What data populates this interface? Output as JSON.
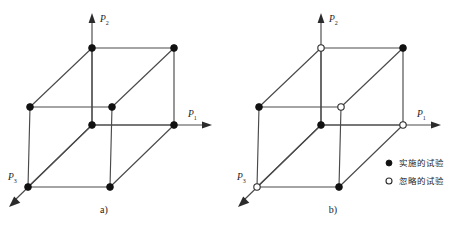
{
  "figure": {
    "title": "",
    "panels": [
      {
        "id": "a",
        "caption": "a)",
        "axes": [
          {
            "name": "p2-axis",
            "base": "P",
            "sub": "2",
            "label": "P2",
            "direction": "up"
          },
          {
            "name": "p1-axis",
            "base": "P",
            "sub": "1",
            "label": "P1",
            "direction": "right"
          },
          {
            "name": "p3-axis",
            "base": "P",
            "sub": "3",
            "label": "P3",
            "direction": "down-left"
          }
        ],
        "vertices": [
          {
            "name": "top-back-left",
            "x": 92,
            "y": 48,
            "state": "filled"
          },
          {
            "name": "top-back-right",
            "x": 174,
            "y": 48,
            "state": "filled"
          },
          {
            "name": "top-front-left",
            "x": 30,
            "y": 107,
            "state": "filled"
          },
          {
            "name": "top-front-right",
            "x": 112,
            "y": 107,
            "state": "filled"
          },
          {
            "name": "bottom-back-left",
            "x": 92,
            "y": 125,
            "state": "filled"
          },
          {
            "name": "bottom-back-right",
            "x": 174,
            "y": 125,
            "state": "filled"
          },
          {
            "name": "bottom-front-left",
            "x": 28,
            "y": 187,
            "state": "filled"
          },
          {
            "name": "bottom-front-right",
            "x": 110,
            "y": 187,
            "state": "filled"
          }
        ]
      },
      {
        "id": "b",
        "caption": "b)",
        "axes": [
          {
            "name": "p2-axis",
            "base": "P",
            "sub": "2",
            "label": "P2",
            "direction": "up"
          },
          {
            "name": "p1-axis",
            "base": "P",
            "sub": "1",
            "label": "P1",
            "direction": "right"
          },
          {
            "name": "p3-axis",
            "base": "P",
            "sub": "3",
            "label": "P3",
            "direction": "down-left"
          }
        ],
        "vertices": [
          {
            "name": "top-back-left",
            "x": 92,
            "y": 48,
            "state": "open"
          },
          {
            "name": "top-back-right",
            "x": 174,
            "y": 48,
            "state": "filled"
          },
          {
            "name": "top-front-left",
            "x": 30,
            "y": 107,
            "state": "filled"
          },
          {
            "name": "top-front-right",
            "x": 112,
            "y": 107,
            "state": "open"
          },
          {
            "name": "bottom-back-left",
            "x": 92,
            "y": 125,
            "state": "filled"
          },
          {
            "name": "bottom-back-right",
            "x": 174,
            "y": 125,
            "state": "open"
          },
          {
            "name": "bottom-front-left",
            "x": 28,
            "y": 187,
            "state": "open"
          },
          {
            "name": "bottom-front-right",
            "x": 110,
            "y": 187,
            "state": "filled"
          }
        ],
        "legend": {
          "position": "bottom-right",
          "entries": [
            {
              "marker": "filled",
              "label": "实施的试验"
            },
            {
              "marker": "open",
              "label": "忽略的试验"
            }
          ]
        }
      }
    ]
  },
  "colors": {
    "edge": "#4a4a4a",
    "node_filled": "#111111",
    "node_open_stroke": "#2b2b2b",
    "background": "#ffffff"
  }
}
